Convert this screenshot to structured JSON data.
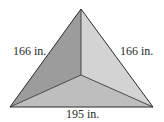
{
  "diagram": {
    "type": "triangular-pyramid-top-view",
    "vertices": {
      "apex": [
        81,
        9
      ],
      "center": [
        81,
        75
      ],
      "bottom_left": [
        10,
        107
      ],
      "bottom_right": [
        153,
        107
      ]
    },
    "faces": {
      "left": {
        "color": "#9c9c9c"
      },
      "right": {
        "color": "#d3d3d3"
      },
      "bottom": {
        "color": "#bebebe"
      }
    },
    "edge_color": "#2b2b2b",
    "labels": {
      "left_edge": "166 in.",
      "right_edge": "166 in.",
      "bottom_edge": "195 in."
    }
  }
}
